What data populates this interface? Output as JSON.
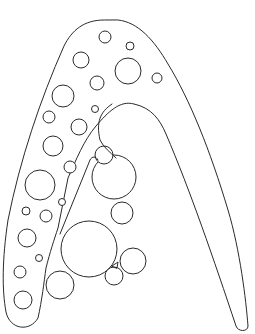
{
  "illustration": {
    "subject": "Letter A coloring page with bubbles",
    "stroke_color": "#2a2a2a",
    "background_color": "#ffffff",
    "outer_outline": "M 104 20 C 84 20 72 30 64 46 C 40 100 20 160 8 220 C 2 260 2 290 6 312 C 10 330 30 332 38 318 C 42 300 44 282 46 268 C 50 252 54 240 58 228 L 68 178 C 76 160 84 140 96 126 C 108 112 120 100 134 104 C 152 108 160 120 166 134 C 190 190 214 260 236 326 C 238 332 248 332 248 326 C 246 300 240 250 228 210 C 210 150 190 100 168 64 C 154 40 138 22 118 20 Z",
    "inner_arch": "M 112 104 C 100 112 96 122 100 140 C 104 148 110 152 116 158",
    "inner_leg_left": "M 60 234 L 90 160 C 92 156 96 156 98 160",
    "bubbles_top": [
      {
        "cx": 105,
        "cy": 37,
        "r": 6
      },
      {
        "cx": 130,
        "cy": 46,
        "r": 4
      },
      {
        "cx": 81,
        "cy": 60,
        "r": 8
      },
      {
        "cx": 128,
        "cy": 71,
        "r": 13
      },
      {
        "cx": 157,
        "cy": 78,
        "r": 5
      },
      {
        "cx": 97,
        "cy": 83,
        "r": 7
      },
      {
        "cx": 63,
        "cy": 96,
        "r": 11
      },
      {
        "cx": 95,
        "cy": 109,
        "r": 3.5
      },
      {
        "cx": 49,
        "cy": 117,
        "r": 6
      },
      {
        "cx": 79,
        "cy": 127,
        "r": 8
      },
      {
        "cx": 53,
        "cy": 146,
        "r": 10
      },
      {
        "cx": 70,
        "cy": 167,
        "r": 6
      },
      {
        "cx": 40,
        "cy": 185,
        "r": 15
      },
      {
        "cx": 62,
        "cy": 202,
        "r": 3.5
      },
      {
        "cx": 26,
        "cy": 211,
        "r": 4
      },
      {
        "cx": 46,
        "cy": 216,
        "r": 6
      },
      {
        "cx": 27,
        "cy": 238,
        "r": 9
      },
      {
        "cx": 39,
        "cy": 258,
        "r": 3.5
      },
      {
        "cx": 20,
        "cy": 272,
        "r": 6
      },
      {
        "cx": 23,
        "cy": 300,
        "r": 9
      }
    ],
    "bubble_cluster": [
      {
        "cx": 114,
        "cy": 177,
        "r": 22
      },
      {
        "cx": 104,
        "cy": 155,
        "r": 9
      },
      {
        "cx": 122,
        "cy": 213,
        "r": 11
      },
      {
        "cx": 89,
        "cy": 249,
        "r": 28
      },
      {
        "cx": 133,
        "cy": 261,
        "r": 13
      },
      {
        "cx": 114,
        "cy": 276,
        "r": 9
      },
      {
        "cx": 60,
        "cy": 285,
        "r": 14
      }
    ],
    "small_triangle": "M 112 266 L 118 262 L 117 268 Z"
  }
}
